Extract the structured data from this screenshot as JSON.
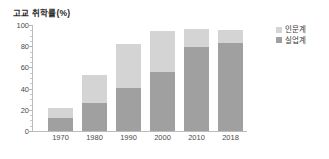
{
  "chart_data": {
    "type": "bar",
    "subtype": "stacked-bar",
    "title": "고교 취학률(%)",
    "xlabel": "",
    "ylabel": "",
    "ylim": [
      0,
      100
    ],
    "yticks": [
      0,
      20,
      40,
      60,
      80,
      100
    ],
    "ytick_labels": [
      "0",
      "20",
      "40",
      "60",
      "80",
      "100"
    ],
    "grid": false,
    "legend_position": "right",
    "categories": [
      "1970",
      "1980",
      "1990",
      "2000",
      "2010",
      "2018"
    ],
    "series": [
      {
        "name": "인문계",
        "color": "#d4d4d4",
        "values": [
          10,
          27,
          41,
          38,
          17,
          12
        ]
      },
      {
        "name": "실업계",
        "color": "#a0a0a0",
        "values": [
          12,
          26,
          41,
          56,
          79,
          83
        ]
      }
    ],
    "totals": [
      22,
      53,
      82,
      94,
      96,
      95
    ]
  },
  "legend": {
    "items": [
      {
        "label": "인문계",
        "swatch": "legend-swatch-academic"
      },
      {
        "label": "실업계",
        "swatch": "legend-swatch-vocational"
      }
    ]
  },
  "colors": {
    "academic": "#d4d4d4",
    "vocational": "#a0a0a0",
    "axis": "#bcbcbc",
    "text": "#3a3a3a",
    "background": "#ffffff"
  }
}
